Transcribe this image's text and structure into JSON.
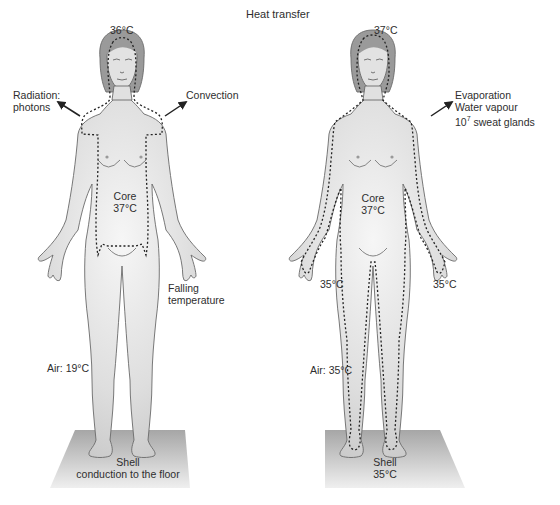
{
  "title": "Heat transfer",
  "colors": {
    "skin": "#d9d9d9",
    "skin_highlight": "#f4f4f4",
    "outline": "#6a6a6a",
    "dotted": "#2a2a2a",
    "hair": "#8f8f8f",
    "floor_top": "#a9a9a9",
    "floor_bottom": "#ededed",
    "text": "#2e2e2e"
  },
  "left_figure": {
    "head_temp": "36°C",
    "radiation": "Radiation:",
    "radiation_2": "photons",
    "convection": "Convection",
    "core_label": "Core",
    "core_temp": "37°C",
    "falling": "Falling",
    "falling_2": "temperature",
    "air": "Air: 19°C",
    "shell": "Shell",
    "shell_2": "conduction to the floor"
  },
  "right_figure": {
    "head_temp": "37°C",
    "evaporation": "Evaporation",
    "water_vapour": "Water vapour",
    "sweat_base": "10",
    "sweat_exp": "7",
    "sweat_rest": " sweat glands",
    "core_label": "Core",
    "core_temp": "37°C",
    "left_temp": "35°C",
    "right_temp": "35°C",
    "air": "Air: 35°C",
    "shell": "Shell",
    "shell_temp": "35°C"
  }
}
